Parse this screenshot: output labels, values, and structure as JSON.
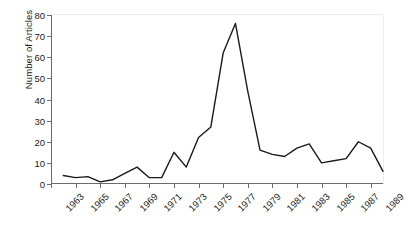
{
  "chart_data": {
    "type": "line",
    "title": "",
    "xlabel": "",
    "ylabel": "Number of Articles",
    "xlim": [
      1963,
      1990
    ],
    "ylim": [
      0,
      80
    ],
    "grid": false,
    "legend": false,
    "legend_position": "none",
    "line_color": "#1a1a1a",
    "axis_color": "#6b6b6b",
    "background_color": "#ffffff",
    "ytick_labels": [
      "0",
      "10",
      "20",
      "30",
      "40",
      "50",
      "60",
      "70",
      "80"
    ],
    "ytick_values": [
      0,
      10,
      20,
      30,
      40,
      50,
      60,
      70,
      80
    ],
    "xtick_labels": [
      "1963",
      "1965",
      "1967",
      "1969",
      "1971",
      "1973",
      "1975",
      "1977",
      "1979",
      "1981",
      "1983",
      "1985",
      "1987",
      "1989"
    ],
    "xtick_values": [
      1963,
      1965,
      1967,
      1969,
      1971,
      1973,
      1975,
      1977,
      1979,
      1981,
      1983,
      1985,
      1987,
      1989
    ],
    "x": [
      1964,
      1965,
      1966,
      1967,
      1968,
      1969,
      1970,
      1971,
      1972,
      1973,
      1974,
      1975,
      1976,
      1977,
      1978,
      1979,
      1980,
      1981,
      1982,
      1983,
      1984,
      1985,
      1986,
      1987,
      1988,
      1989,
      1990
    ],
    "values": [
      4,
      3,
      3.5,
      1,
      2,
      5,
      8,
      3,
      3,
      15,
      8,
      22,
      27,
      62,
      76,
      44,
      16,
      14,
      13,
      17,
      19,
      10,
      11,
      12,
      20,
      17,
      6
    ],
    "series": [
      {
        "name": "Number of Articles",
        "values": [
          4,
          3,
          3.5,
          1,
          2,
          5,
          8,
          3,
          3,
          15,
          8,
          22,
          27,
          62,
          76,
          44,
          16,
          14,
          13,
          17,
          19,
          10,
          11,
          12,
          20,
          17,
          6
        ]
      }
    ]
  }
}
